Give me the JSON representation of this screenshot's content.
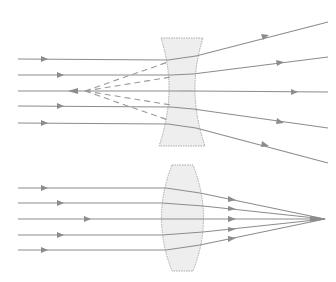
{
  "diagram": {
    "colors": {
      "ray": "#8c8c8c",
      "lens_fill": "#eeeeee",
      "lens_stroke": "#a0a0a0",
      "background": "#ffffff"
    },
    "concave_lens": {
      "label": "diverging-lens",
      "incoming_rays_y": [
        59,
        75,
        91,
        106,
        123
      ],
      "virtual_focus": {
        "x": 85,
        "y": 91
      },
      "outgoing_ends": [
        [
          328,
          22
        ],
        [
          328,
          57
        ],
        [
          328,
          92
        ],
        [
          328,
          128
        ],
        [
          328,
          163
        ]
      ]
    },
    "convex_lens": {
      "label": "converging-lens",
      "incoming_rays_y": [
        188,
        203,
        219,
        235,
        250
      ],
      "focus": {
        "x": 325,
        "y": 219
      }
    }
  }
}
